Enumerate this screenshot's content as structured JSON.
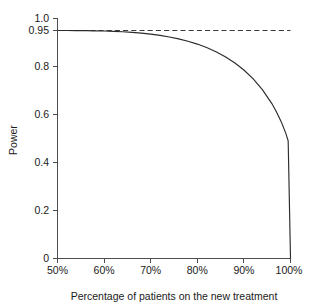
{
  "chart_data": {
    "type": "line",
    "title": "",
    "xlabel": "Percentage of patients on the new treatment",
    "ylabel": "Power",
    "xlim": [
      50,
      100
    ],
    "ylim": [
      0,
      1.0
    ],
    "grid": false,
    "legend": null,
    "x_tick_labels": [
      "50%",
      "60%",
      "70%",
      "80%",
      "90%",
      "100%"
    ],
    "x_tick_values": [
      50,
      60,
      70,
      80,
      90,
      100
    ],
    "y_tick_labels": [
      "1.0",
      "0.95",
      "0.8",
      "0.6",
      "0.4",
      "0.2",
      "0"
    ],
    "y_tick_values": [
      1.0,
      0.95,
      0.8,
      0.6,
      0.4,
      0.2,
      0
    ],
    "series": [
      {
        "name": "Power curve",
        "style": "solid",
        "x": [
          50,
          52,
          54,
          56,
          58,
          60,
          62,
          64,
          66,
          68,
          70,
          72,
          74,
          76,
          78,
          80,
          82,
          84,
          86,
          88,
          90,
          92,
          94,
          96,
          97,
          98,
          99,
          99.5,
          100
        ],
        "values": [
          0.95,
          0.9499,
          0.9497,
          0.9493,
          0.9487,
          0.9478,
          0.9464,
          0.9446,
          0.9421,
          0.9389,
          0.9348,
          0.9296,
          0.9231,
          0.9151,
          0.9053,
          0.8934,
          0.879,
          0.8617,
          0.8408,
          0.8156,
          0.7852,
          0.7482,
          0.7027,
          0.6455,
          0.6108,
          0.5702,
          0.5213,
          0.4903,
          0.0
        ]
      },
      {
        "name": "Reference level 0.95",
        "style": "dashed",
        "x": [
          50,
          100
        ],
        "values": [
          0.95,
          0.95
        ]
      }
    ],
    "annotations": []
  }
}
